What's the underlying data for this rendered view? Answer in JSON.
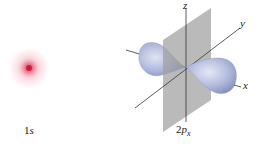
{
  "orbital_1s": {
    "label_num": "1",
    "label_sub": "s",
    "color": "#e0405a"
  },
  "orbital_2px": {
    "label_num": "2",
    "label_p": "p",
    "label_sub": "x",
    "lobe_color": "#aab4d8",
    "plane_color": "#a8a8a8"
  },
  "axes": {
    "x": "x",
    "y": "y",
    "z": "z"
  }
}
